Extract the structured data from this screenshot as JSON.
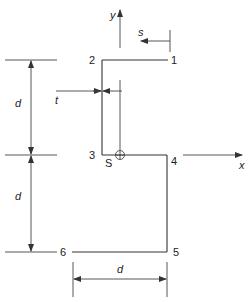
{
  "diagram": {
    "type": "cross-section",
    "points": [
      {
        "id": "1",
        "label": "1"
      },
      {
        "id": "2",
        "label": "2"
      },
      {
        "id": "3",
        "label": "3"
      },
      {
        "id": "4",
        "label": "4"
      },
      {
        "id": "5",
        "label": "5"
      },
      {
        "id": "6",
        "label": "6"
      }
    ],
    "axes": {
      "x_label": "x",
      "y_label": "y"
    },
    "shear_center_label": "S",
    "contour_coordinate_label": "s",
    "thickness_label": "t",
    "dimensions": {
      "upper_height": "d",
      "lower_height": "d",
      "bottom_width": "d"
    },
    "colors": {
      "line": "#333333",
      "background": "#ffffff"
    }
  }
}
